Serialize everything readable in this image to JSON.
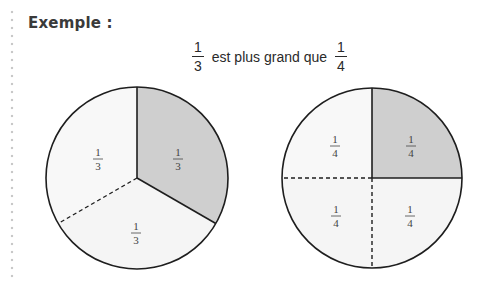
{
  "heading": "Exemple :",
  "statement": {
    "left_fraction": {
      "numerator": "1",
      "denominator": "3"
    },
    "text": "est plus grand que",
    "right_fraction": {
      "numerator": "1",
      "denominator": "4"
    }
  },
  "colors": {
    "shaded": "#cfcfcf",
    "unshaded": "#f5f5f5",
    "outline": "#1e1e1e"
  },
  "diagrams": [
    {
      "name": "thirds-circle",
      "parts": 3,
      "shaded_parts": 1,
      "labels": [
        {
          "numerator": "1",
          "denominator": "3",
          "position": "upper-right",
          "shaded": true
        },
        {
          "numerator": "1",
          "denominator": "3",
          "position": "upper-left",
          "shaded": false
        },
        {
          "numerator": "1",
          "denominator": "3",
          "position": "bottom",
          "shaded": false
        }
      ]
    },
    {
      "name": "quarters-circle",
      "parts": 4,
      "shaded_parts": 1,
      "labels": [
        {
          "numerator": "1",
          "denominator": "4",
          "position": "upper-right",
          "shaded": true
        },
        {
          "numerator": "1",
          "denominator": "4",
          "position": "upper-left",
          "shaded": false
        },
        {
          "numerator": "1",
          "denominator": "4",
          "position": "lower-left",
          "shaded": false
        },
        {
          "numerator": "1",
          "denominator": "4",
          "position": "lower-right",
          "shaded": false
        }
      ]
    }
  ]
}
